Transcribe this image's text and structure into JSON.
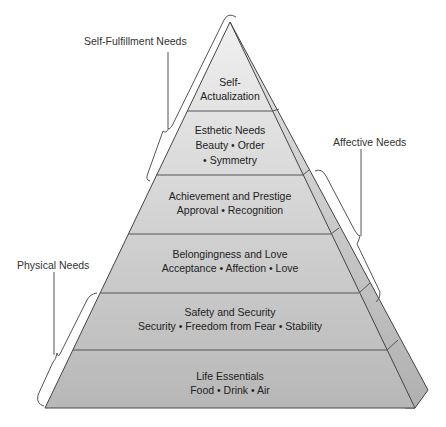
{
  "diagram": {
    "type": "pyramid",
    "title": "",
    "layers": [
      {
        "title": "Self-",
        "title2": "Actualization",
        "subtitle": ""
      },
      {
        "title": "Esthetic Needs",
        "subtitle": "Beauty • Order",
        "subtitle2": "• Symmetry"
      },
      {
        "title": "Achievement and Prestige",
        "subtitle": "Approval • Recognition"
      },
      {
        "title": "Belongingness and Love",
        "subtitle": "Acceptance • Affection • Love"
      },
      {
        "title": "Safety and Security",
        "subtitle": "Security • Freedom from Fear • Stability"
      },
      {
        "title": "Life Essentials",
        "subtitle": "Food • Drink • Air"
      }
    ],
    "groups": [
      {
        "label": "Self-Fulfillment Needs",
        "spans": [
          "Self-Actualization",
          "Esthetic Needs"
        ],
        "side": "left"
      },
      {
        "label": "Affective Needs",
        "spans": [
          "Achievement and Prestige",
          "Belongingness and Love"
        ],
        "side": "right"
      },
      {
        "label": "Physical Needs",
        "spans": [
          "Safety and Security",
          "Life Essentials"
        ],
        "side": "left"
      }
    ],
    "colors": {
      "top_fill": "#efefef",
      "bottom_fill": "#b9b9b9",
      "side_fill": "#c4c4c4",
      "line": "#444444",
      "bracket": "#555555"
    }
  }
}
